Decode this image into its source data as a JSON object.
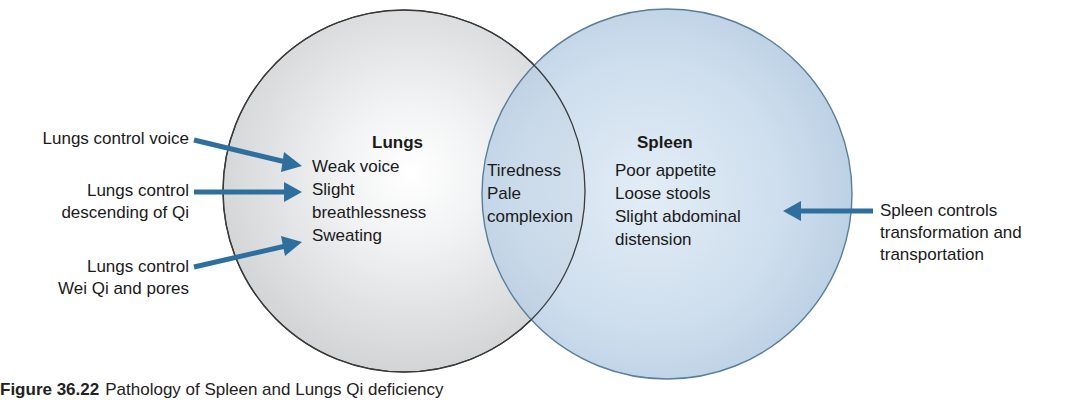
{
  "colors": {
    "arrow": "#2e6f9e",
    "lungs_circle_fill": "#e2e3e4",
    "lungs_circle_stroke": "#3a3a3a",
    "spleen_circle_fill": "#bcd2e6",
    "spleen_circle_stroke": "#5a7d9a"
  },
  "lungs": {
    "title": "Lungs",
    "symptoms": [
      "Weak voice",
      "Slight",
      "breathlessness",
      "Sweating"
    ]
  },
  "overlap": {
    "symptoms": [
      "Tiredness",
      "Pale",
      "complexion"
    ]
  },
  "spleen": {
    "title": "Spleen",
    "symptoms": [
      "Poor appetite",
      "Loose stools",
      "Slight abdominal",
      "distension"
    ]
  },
  "left_labels": [
    {
      "lines": [
        "Lungs control voice"
      ]
    },
    {
      "lines": [
        "Lungs control",
        "descending of Qi"
      ]
    },
    {
      "lines": [
        "Lungs control",
        "Wei Qi and pores"
      ]
    }
  ],
  "right_label": {
    "lines": [
      "Spleen controls",
      "transformation and",
      "transportation"
    ]
  },
  "caption": {
    "figure_number": "Figure 36.22",
    "text": "Pathology of Spleen and Lungs Qi deficiency"
  }
}
